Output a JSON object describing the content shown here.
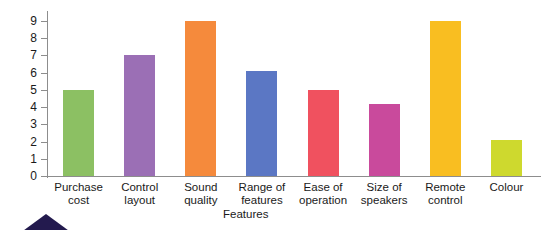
{
  "chart_data": {
    "type": "bar",
    "title": "",
    "subtitle": "",
    "xlabel": "Features",
    "ylabel": "",
    "ylim": [
      0,
      9
    ],
    "yticks": [
      0,
      1,
      2,
      3,
      4,
      5,
      6,
      7,
      8,
      9
    ],
    "ytick_labels": [
      "0",
      "1",
      "2",
      "3",
      "4",
      "5",
      "6",
      "7",
      "8",
      "9"
    ],
    "grid": false,
    "legend": false,
    "legend_position": "none",
    "categories": [
      "Purchase cost",
      "Control layout",
      "Sound quality",
      "Range of features",
      "Ease of operation",
      "Size of speakers",
      "Remote control",
      "Colour"
    ],
    "category_lines": [
      [
        "Purchase",
        "cost"
      ],
      [
        "Control",
        "layout"
      ],
      [
        "Sound",
        "quality"
      ],
      [
        "Range of",
        "features"
      ],
      [
        "Ease of",
        "operation"
      ],
      [
        "Size of",
        "speakers"
      ],
      [
        "Remote",
        "control"
      ],
      [
        "Colour"
      ]
    ],
    "values": [
      5,
      7,
      9,
      6.1,
      5,
      4.2,
      9,
      2.1
    ],
    "colors": [
      "#8cc063",
      "#9b6fb5",
      "#f58a3c",
      "#5b77c4",
      "#f0515f",
      "#c94a9c",
      "#f9be21",
      "#ced92e"
    ],
    "bars": [
      {
        "label": "Purchase cost",
        "value": 5,
        "color": "#8cc063"
      },
      {
        "label": "Control layout",
        "value": 7,
        "color": "#9b6fb5"
      },
      {
        "label": "Sound quality",
        "value": 9,
        "color": "#f58a3c"
      },
      {
        "label": "Range of features",
        "value": 6.1,
        "color": "#5b77c4"
      },
      {
        "label": "Ease of operation",
        "value": 5,
        "color": "#f0515f"
      },
      {
        "label": "Size of speakers",
        "value": 4.2,
        "color": "#c94a9c"
      },
      {
        "label": "Remote control",
        "value": 9,
        "color": "#f9be21"
      },
      {
        "label": "Colour",
        "value": 2.1,
        "color": "#ced92e"
      }
    ]
  },
  "axis": {
    "axis_color": "#8d8d8d",
    "tick_color": "#8d8d8d",
    "label_color": "#1a1a1a"
  },
  "decoration": {
    "triangle_color": "#231a4e",
    "triangle_name": "navy-triangle"
  }
}
